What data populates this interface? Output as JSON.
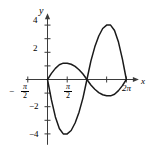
{
  "chart_data": {
    "type": "line",
    "title": "",
    "xlabel": "x",
    "ylabel": "y",
    "xlim": [
      -1.5707963,
      7.2
    ],
    "ylim": [
      -4.8,
      4.8
    ],
    "grid": false,
    "legend": false,
    "x_tick_labels": [
      "-π/2",
      "π/2",
      "2π"
    ],
    "x_tick_values": [
      -1.5707963,
      1.5707963,
      6.2831853
    ],
    "x_untitled_ticks": [
      4.712389
    ],
    "y_tick_labels": [
      "4",
      "2",
      "-2",
      "-4"
    ],
    "y_tick_values": [
      4,
      2,
      -2,
      -4
    ],
    "y_untitled_ticks": [
      3,
      1,
      -1,
      -3
    ],
    "series": [
      {
        "name": "small-amplitude-curve",
        "domain": [
          0,
          6.2831853
        ],
        "x": [
          0.0,
          0.3141593,
          0.6283185,
          0.9424778,
          1.2566371,
          1.5707963,
          1.8849556,
          2.1991149,
          2.5132741,
          2.8274334,
          3.1415927,
          3.4557519,
          3.7699112,
          4.0840704,
          4.3982297,
          4.712389,
          5.0265482,
          5.3407075,
          5.6548668,
          5.969026,
          6.2831853
        ],
        "y": [
          0.0,
          0.45,
          0.82,
          1.08,
          1.2,
          1.2,
          1.12,
          0.96,
          0.72,
          0.4,
          0.0,
          -0.4,
          -0.72,
          -0.96,
          -1.12,
          -1.2,
          -1.2,
          -1.08,
          -0.82,
          -0.45,
          0.0
        ]
      },
      {
        "name": "large-amplitude-curve",
        "domain": [
          0,
          6.2831853
        ],
        "x": [
          0.0,
          0.3141593,
          0.6283185,
          0.9424778,
          1.2566371,
          1.5707963,
          1.8849556,
          2.1991149,
          2.5132741,
          2.8274334,
          3.1415927,
          3.4557519,
          3.7699112,
          4.0840704,
          4.3982297,
          4.712389,
          5.0265482,
          5.3407075,
          5.6548668,
          5.969026,
          6.2831853
        ],
        "y": [
          0.0,
          -1.5,
          -2.75,
          -3.6,
          -4.0,
          -4.0,
          -3.75,
          -3.2,
          -2.4,
          -1.35,
          0.0,
          1.35,
          2.4,
          3.2,
          3.75,
          4.0,
          4.0,
          3.6,
          2.75,
          1.5,
          0.0
        ]
      }
    ],
    "curve_color": "#1a1a1a",
    "axis_color": "#3b3b3b"
  },
  "axes": {
    "y_axis_label": "y",
    "x_axis_label": "x",
    "x_label_neg_half_pi_sign": "−",
    "x_label_neg_half_pi_num": "π",
    "x_label_neg_half_pi_den": "2",
    "x_label_half_pi_num": "π",
    "x_label_half_pi_den": "2",
    "x_label_two_pi": "2π",
    "y_label_4": "4",
    "y_label_2": "2",
    "y_label_neg2": "−2",
    "y_label_neg4": "−4"
  }
}
